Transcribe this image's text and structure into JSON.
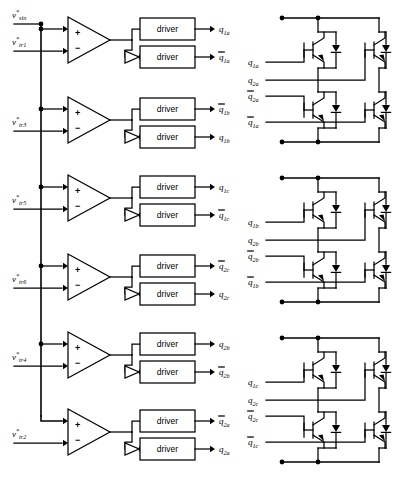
{
  "diagram": {
    "driver_label": "driver",
    "comparator_plus": "+",
    "comparator_minus": "−"
  },
  "inputs": {
    "modulating": {
      "base": "v",
      "sup": "*",
      "sub": "sin"
    },
    "carriers": [
      {
        "base": "v",
        "sup": "*",
        "sub": "tr1"
      },
      {
        "base": "v",
        "sup": "*",
        "sub": "tr3"
      },
      {
        "base": "v",
        "sup": "*",
        "sub": "tr5"
      },
      {
        "base": "v",
        "sup": "*",
        "sub": "tr6"
      },
      {
        "base": "v",
        "sup": "*",
        "sub": "tr4"
      },
      {
        "base": "v",
        "sup": "*",
        "sub": "tr2"
      }
    ]
  },
  "channels": [
    {
      "carrier_sub": "tr1",
      "top_out": {
        "base": "q",
        "sub": "1a",
        "bar": false
      },
      "bot_out": {
        "base": "q",
        "sub": "1a",
        "bar": true
      }
    },
    {
      "carrier_sub": "tr3",
      "top_out": {
        "base": "q",
        "sub": "1b",
        "bar": true
      },
      "bot_out": {
        "base": "q",
        "sub": "1b",
        "bar": false
      }
    },
    {
      "carrier_sub": "tr5",
      "top_out": {
        "base": "q",
        "sub": "1c",
        "bar": false
      },
      "bot_out": {
        "base": "q",
        "sub": "1c",
        "bar": true
      }
    },
    {
      "carrier_sub": "tr6",
      "top_out": {
        "base": "q",
        "sub": "2c",
        "bar": true
      },
      "bot_out": {
        "base": "q",
        "sub": "2c",
        "bar": false
      }
    },
    {
      "carrier_sub": "tr4",
      "top_out": {
        "base": "q",
        "sub": "2b",
        "bar": false
      },
      "bot_out": {
        "base": "q",
        "sub": "2b",
        "bar": true
      }
    },
    {
      "carrier_sub": "tr2",
      "top_out": {
        "base": "q",
        "sub": "2a",
        "bar": true
      },
      "bot_out": {
        "base": "q",
        "sub": "2a",
        "bar": false
      }
    }
  ],
  "bridges": [
    {
      "name": "bridge-a",
      "gates": [
        {
          "base": "q",
          "sub": "1a",
          "bar": false
        },
        {
          "base": "q",
          "sub": "2a",
          "bar": false
        },
        {
          "base": "q",
          "sub": "2a",
          "bar": true
        },
        {
          "base": "q",
          "sub": "1a",
          "bar": true
        }
      ]
    },
    {
      "name": "bridge-b",
      "gates": [
        {
          "base": "q",
          "sub": "1b",
          "bar": false
        },
        {
          "base": "q",
          "sub": "2b",
          "bar": false
        },
        {
          "base": "q",
          "sub": "2b",
          "bar": true
        },
        {
          "base": "q",
          "sub": "1b",
          "bar": true
        }
      ]
    },
    {
      "name": "bridge-c",
      "gates": [
        {
          "base": "q",
          "sub": "1c",
          "bar": false
        },
        {
          "base": "q",
          "sub": "2c",
          "bar": false
        },
        {
          "base": "q",
          "sub": "2c",
          "bar": true
        },
        {
          "base": "q",
          "sub": "1c",
          "bar": true
        }
      ]
    }
  ],
  "colors": {
    "ink": "#000000",
    "paper": "#ffffff"
  }
}
